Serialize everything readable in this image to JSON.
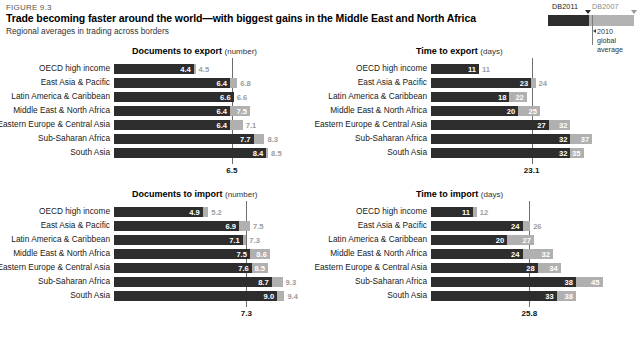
{
  "header": {
    "figure_label": "FIGURE 9.3",
    "title": "Trade becoming faster around the world—with biggest gains in the Middle East and North Africa",
    "subtitle": "Regional averages in trading across borders"
  },
  "legend": {
    "series_new_label": "DB2011",
    "series_old_label": "DB2007",
    "note": "2010\nglobal\naverage",
    "note_line1": "2010",
    "note_line2": "global",
    "note_line3": "average",
    "color_new": "#2d2d2d",
    "color_old": "#b0b0b0",
    "gridline_color": "#6e6e6e"
  },
  "regions": [
    "OECD high income",
    "East Asia & Pacific",
    "Latin America & Caribbean",
    "Middle East & North Africa",
    "Eastern Europe & Central Asia",
    "Sub-Saharan Africa",
    "South Asia"
  ],
  "chart_data": [
    {
      "id": "documents-to-export",
      "type": "bar",
      "orientation": "horizontal",
      "title": "Documents to export",
      "unit": "(number)",
      "xlabel": "",
      "ylabel": "",
      "categories": [
        "OECD high income",
        "East Asia & Pacific",
        "Latin America & Caribbean",
        "Middle East & North Africa",
        "Eastern Europe & Central Asia",
        "Sub-Saharan Africa",
        "South Asia"
      ],
      "series": [
        {
          "name": "DB2011",
          "values": [
            4.4,
            6.4,
            6.6,
            6.4,
            6.4,
            7.7,
            8.4
          ]
        },
        {
          "name": "DB2007",
          "values": [
            4.5,
            6.8,
            6.6,
            7.5,
            7.1,
            8.3,
            8.5
          ]
        }
      ],
      "labels_new": [
        "4.4",
        "6.4",
        "6.6",
        "6.4",
        "6.4",
        "7.7",
        "8.4"
      ],
      "labels_old": [
        "4.5",
        "6.8",
        "6.6",
        "7.5",
        "7.1",
        "8.3",
        "8.5"
      ],
      "reference_line": {
        "value": 6.5,
        "label": "6.5",
        "name": "2010 global average"
      },
      "xmax": 9.6,
      "grid": false,
      "legend_position": "top-right"
    },
    {
      "id": "time-to-export",
      "type": "bar",
      "orientation": "horizontal",
      "title": "Time to export",
      "unit": "(days)",
      "xlabel": "",
      "ylabel": "",
      "categories": [
        "OECD high income",
        "East Asia & Pacific",
        "Latin America & Caribbean",
        "Middle East & North Africa",
        "Eastern Europe & Central Asia",
        "Sub-Saharan Africa",
        "South Asia"
      ],
      "series": [
        {
          "name": "DB2011",
          "values": [
            11,
            23,
            18,
            20,
            27,
            32,
            32
          ]
        },
        {
          "name": "DB2007",
          "values": [
            11,
            24,
            22,
            25,
            32,
            37,
            35
          ]
        }
      ],
      "labels_new": [
        "11",
        "23",
        "18",
        "20",
        "27",
        "32",
        "32"
      ],
      "labels_old": [
        "11",
        "24",
        "22",
        "25",
        "32",
        "37",
        "35"
      ],
      "reference_line": {
        "value": 23.1,
        "label": "23.1",
        "name": "2010 global average"
      },
      "xmax": 42,
      "grid": false,
      "legend_position": "top-right"
    },
    {
      "id": "documents-to-import",
      "type": "bar",
      "orientation": "horizontal",
      "title": "Documents to import",
      "unit": "(number)",
      "xlabel": "",
      "ylabel": "",
      "categories": [
        "OECD high income",
        "East Asia & Pacific",
        "Latin America & Caribbean",
        "Middle East & North Africa",
        "Eastern Europe & Central Asia",
        "Sub-Saharan Africa",
        "South Asia"
      ],
      "series": [
        {
          "name": "DB2011",
          "values": [
            4.9,
            6.9,
            7.1,
            7.5,
            7.6,
            8.7,
            9.0
          ]
        },
        {
          "name": "DB2007",
          "values": [
            5.2,
            7.5,
            7.3,
            8.6,
            8.5,
            9.3,
            9.4
          ]
        }
      ],
      "labels_new": [
        "4.9",
        "6.9",
        "7.1",
        "7.5",
        "7.6",
        "8.7",
        "9.0"
      ],
      "labels_old": [
        "5.2",
        "7.5",
        "7.3",
        "8.6",
        "8.5",
        "9.3",
        "9.4"
      ],
      "reference_line": {
        "value": 7.3,
        "label": "7.3",
        "name": "2010 global average"
      },
      "xmax": 9.6,
      "grid": false,
      "legend_position": "top-right"
    },
    {
      "id": "time-to-import",
      "type": "bar",
      "orientation": "horizontal",
      "title": "Time to import",
      "unit": "(days)",
      "xlabel": "",
      "ylabel": "",
      "categories": [
        "OECD high income",
        "East Asia & Pacific",
        "Latin America & Caribbean",
        "Middle East & North Africa",
        "Eastern Europe & Central Asia",
        "Sub-Saharan Africa",
        "South Asia"
      ],
      "series": [
        {
          "name": "DB2011",
          "values": [
            11,
            24,
            20,
            24,
            28,
            38,
            33
          ]
        },
        {
          "name": "DB2007",
          "values": [
            12,
            26,
            27,
            32,
            34,
            45,
            38
          ]
        }
      ],
      "labels_new": [
        "11",
        "24",
        "20",
        "24",
        "28",
        "38",
        "33"
      ],
      "labels_old": [
        "12",
        "26",
        "27",
        "32",
        "34",
        "45",
        "38"
      ],
      "reference_line": {
        "value": 25.8,
        "label": "25.8",
        "name": "2010 global average"
      },
      "xmax": 48,
      "grid": false,
      "legend_position": "top-right"
    }
  ]
}
